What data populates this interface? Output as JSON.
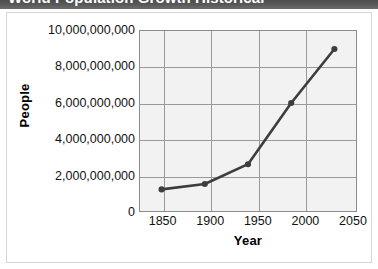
{
  "title_bar": {
    "title": "World Population Growth Historical"
  },
  "chart_data": {
    "type": "line",
    "title": "World Population Growth Historical",
    "xlabel": "Year",
    "ylabel": "People",
    "x": [
      1850,
      1900,
      1950,
      2000,
      2050
    ],
    "values": [
      1200000000,
      1500000000,
      2600000000,
      6000000000,
      9000000000
    ],
    "xtick_labels": [
      "1850",
      "1900",
      "1950",
      "2000",
      "2050"
    ],
    "ytick_labels": [
      "0",
      "2,000,000,000",
      "4,000,000,000",
      "6,000,000,000",
      "8,000,000,000",
      "10,000,000,000"
    ],
    "ytick_values": [
      0,
      2000000000,
      4000000000,
      6000000000,
      8000000000,
      10000000000
    ],
    "xlim": [
      1825,
      2075
    ],
    "ylim": [
      0,
      10000000000
    ],
    "grid": true,
    "legend": null,
    "series_color": "#3d3d3d",
    "plot_bg_color": "#f2f2f2",
    "grid_color": "#9a9a9a",
    "marker": "circle"
  }
}
